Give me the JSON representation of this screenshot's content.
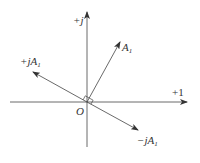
{
  "diagram": {
    "title": "",
    "type": "phasor-diagram",
    "axes": {
      "real": {
        "label": "+1"
      },
      "imaginary": {
        "label": "+j"
      },
      "origin": {
        "label": "O"
      }
    },
    "phasors": [
      {
        "id": "A1",
        "label_prefix": "",
        "label_main": "A",
        "label_sub": "1",
        "angle_deg": 61
      },
      {
        "id": "plus_jA1",
        "label_prefix": "+j",
        "label_main": "A",
        "label_sub": "1",
        "angle_deg": 151
      },
      {
        "id": "minus_jA1",
        "label_prefix": "−j",
        "label_main": "A",
        "label_sub": "1",
        "angle_deg": -29
      }
    ],
    "annotations": {
      "right_angle_markers": 2
    },
    "colors": {
      "line": "#333333",
      "background": "#ffffff"
    }
  }
}
